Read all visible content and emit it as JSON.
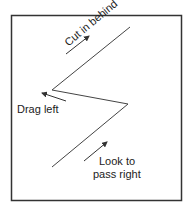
{
  "diagram": {
    "labels": {
      "cut_in_behind": "Cut in behind",
      "drag_left": "Drag left",
      "look_to_pass_line1": "Look to",
      "look_to_pass_line2": "pass right"
    },
    "colors": {
      "line": "#333333",
      "frame": "#333333"
    }
  }
}
